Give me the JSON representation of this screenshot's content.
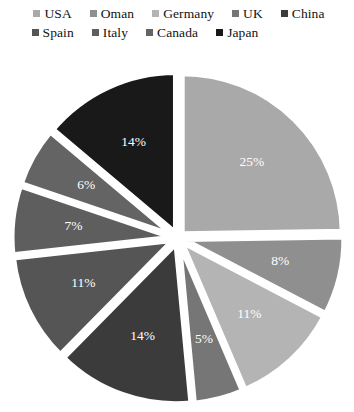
{
  "chart_data": {
    "type": "pie",
    "title": "",
    "subtitle": "",
    "xlabel": "",
    "ylabel": "",
    "grid": false,
    "legend_position": "top",
    "exploded": true,
    "start_angle_deg": 0,
    "direction": "clockwise",
    "units": "percent",
    "categories": [
      "USA",
      "Oman",
      "Germany",
      "UK",
      "China",
      "Spain",
      "Italy",
      "Canada",
      "Japan"
    ],
    "values": [
      25,
      8,
      11,
      5,
      14,
      11,
      7,
      6,
      14
    ],
    "labels": [
      "25%",
      "8%",
      "11%",
      "5%",
      "14%",
      "11%",
      "7%",
      "6%",
      "14%"
    ],
    "colors": [
      "#a9a9a9",
      "#8f8f8f",
      "#b4b4b4",
      "#767676",
      "#3b3b3b",
      "#555555",
      "#5e5e5e",
      "#646464",
      "#191919"
    ],
    "slices": [
      {
        "name": "USA",
        "value": 25,
        "label": "25%",
        "color": "#a9a9a9"
      },
      {
        "name": "Oman",
        "value": 8,
        "label": "8%",
        "color": "#8f8f8f"
      },
      {
        "name": "Germany",
        "value": 11,
        "label": "11%",
        "color": "#b4b4b4"
      },
      {
        "name": "UK",
        "value": 5,
        "label": "5%",
        "color": "#767676"
      },
      {
        "name": "China",
        "value": 14,
        "label": "14%",
        "color": "#3b3b3b"
      },
      {
        "name": "Spain",
        "value": 11,
        "label": "11%",
        "color": "#555555"
      },
      {
        "name": "Italy",
        "value": 7,
        "label": "7%",
        "color": "#5e5e5e"
      },
      {
        "name": "Canada",
        "value": 6,
        "label": "6%",
        "color": "#646464"
      },
      {
        "name": "Japan",
        "value": 14,
        "label": "14%",
        "color": "#191919"
      }
    ]
  },
  "legend": {
    "rows": [
      [
        {
          "label": "USA",
          "color": "#a9a9a9"
        },
        {
          "label": "Oman",
          "color": "#8f8f8f"
        },
        {
          "label": "Germany",
          "color": "#b4b4b4"
        },
        {
          "label": "UK",
          "color": "#767676"
        },
        {
          "label": "China",
          "color": "#3b3b3b"
        }
      ],
      [
        {
          "label": "Spain",
          "color": "#555555"
        },
        {
          "label": "Italy",
          "color": "#5e5e5e"
        },
        {
          "label": "Canada",
          "color": "#646464"
        },
        {
          "label": "Japan",
          "color": "#191919"
        }
      ]
    ]
  },
  "style": {
    "background": "#ffffff",
    "label_text_color": "#ffffff",
    "legend_text_color": "#121212",
    "gap_color": "#ffffff"
  }
}
